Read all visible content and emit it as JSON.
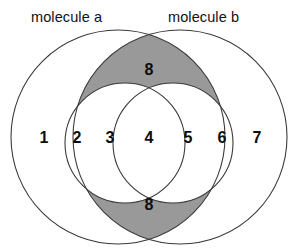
{
  "diagram": {
    "type": "venn",
    "title": "",
    "labels": {
      "left_set": "molecule a",
      "right_set": "molecule b"
    },
    "colors": {
      "background": "#ffffff",
      "stroke": "#3a3a3a",
      "shaded_fill": "#999999",
      "text": "#0d0d0d"
    },
    "regions": [
      {
        "id": "r1",
        "label": "1",
        "shaded": false,
        "x": 44,
        "y": 138
      },
      {
        "id": "r2",
        "label": "2",
        "shaded": false,
        "x": 77,
        "y": 138
      },
      {
        "id": "r3",
        "label": "3",
        "shaded": false,
        "x": 110,
        "y": 138
      },
      {
        "id": "r4",
        "label": "4",
        "shaded": false,
        "x": 149,
        "y": 138
      },
      {
        "id": "r5",
        "label": "5",
        "shaded": false,
        "x": 188,
        "y": 138
      },
      {
        "id": "r6",
        "label": "6",
        "shaded": false,
        "x": 222,
        "y": 138
      },
      {
        "id": "r7",
        "label": "7",
        "shaded": false,
        "x": 257,
        "y": 138
      },
      {
        "id": "r8_top",
        "label": "8",
        "shaded": true,
        "x": 149,
        "y": 70
      },
      {
        "id": "r8_bottom",
        "label": "8",
        "shaded": true,
        "x": 149,
        "y": 205
      }
    ],
    "circles": [
      {
        "id": "outer-left",
        "cx": 118,
        "cy": 137,
        "r": 107,
        "role": "molecule-a-outer"
      },
      {
        "id": "outer-right",
        "cx": 180,
        "cy": 137,
        "r": 107,
        "role": "molecule-b-outer"
      },
      {
        "id": "inner-left",
        "cx": 125,
        "cy": 143,
        "r": 60,
        "role": "molecule-a-inner"
      },
      {
        "id": "inner-right",
        "cx": 173,
        "cy": 143,
        "r": 60,
        "role": "molecule-b-inner"
      }
    ]
  }
}
